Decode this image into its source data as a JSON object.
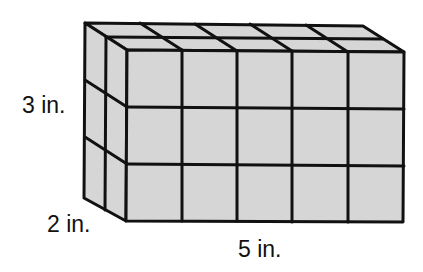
{
  "figure": {
    "type": "rectangular prism of unit cubes",
    "fill_color": "#d6d6d6",
    "line_color": "#111111",
    "dimensions": {
      "length": 5,
      "width": 2,
      "height": 3,
      "unit": "in."
    }
  },
  "labels": {
    "height": "3 in.",
    "width": "2 in.",
    "length": "5 in."
  }
}
